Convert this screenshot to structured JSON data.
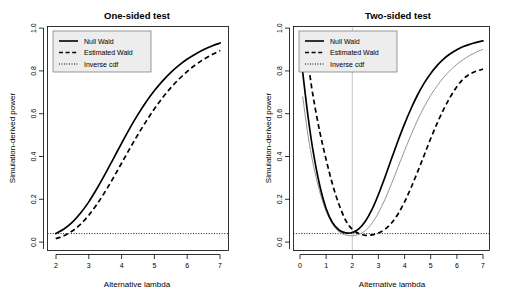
{
  "figure": {
    "background": "#ffffff",
    "panel_count": 2
  },
  "chart_data": [
    {
      "type": "line",
      "panel": "left",
      "title": "One-sided test",
      "xlabel": "Alternative lambda",
      "ylabel": "Simulation-derived power",
      "xlim": [
        1.75,
        7.25
      ],
      "ylim": [
        -0.03,
        1.03
      ],
      "xticks": [
        "2",
        "3",
        "4",
        "5",
        "6",
        "7"
      ],
      "xtick_values": [
        2,
        3,
        4,
        5,
        6,
        7
      ],
      "yticks": [
        "0.0",
        "0.2",
        "0.4",
        "0.6",
        "0.8",
        "1.0"
      ],
      "ytick_values": [
        0.0,
        0.2,
        0.4,
        0.6,
        0.8,
        1.0
      ],
      "grid": false,
      "legend_position": "top-left",
      "legend": [
        "Null Wald",
        "Estimated Wald",
        "Inverse cdf"
      ],
      "reference_lines": [
        {
          "orientation": "horizontal",
          "value": 0.05,
          "style": "dotted",
          "color": "#000000"
        }
      ],
      "x": [
        2.0,
        2.25,
        2.5,
        2.75,
        3.0,
        3.25,
        3.5,
        3.75,
        4.0,
        4.25,
        4.5,
        4.75,
        5.0,
        5.25,
        5.5,
        5.75,
        6.0,
        6.25,
        6.5,
        6.75,
        7.0
      ],
      "series": [
        {
          "name": "Null Wald",
          "style": "solid",
          "color": "#000000",
          "values": [
            0.05,
            0.072,
            0.103,
            0.146,
            0.199,
            0.262,
            0.331,
            0.404,
            0.477,
            0.548,
            0.614,
            0.674,
            0.727,
            0.773,
            0.813,
            0.847,
            0.876,
            0.9,
            0.921,
            0.938,
            0.952
          ]
        },
        {
          "name": "Estimated Wald",
          "style": "dashed",
          "color": "#000000",
          "values": [
            0.026,
            0.04,
            0.062,
            0.094,
            0.136,
            0.188,
            0.248,
            0.314,
            0.383,
            0.452,
            0.519,
            0.582,
            0.641,
            0.694,
            0.741,
            0.782,
            0.818,
            0.849,
            0.875,
            0.897,
            0.916
          ]
        }
      ]
    },
    {
      "type": "line",
      "panel": "right",
      "title": "Two-sided test",
      "xlabel": "Alternative lambda",
      "ylabel": "Simulation-derived power",
      "xlim": [
        -0.25,
        7.25
      ],
      "ylim": [
        -0.03,
        1.03
      ],
      "xticks": [
        "0",
        "1",
        "2",
        "3",
        "4",
        "5",
        "6",
        "7"
      ],
      "xtick_values": [
        0,
        1,
        2,
        3,
        4,
        5,
        6,
        7
      ],
      "yticks": [
        "0.0",
        "0.2",
        "0.4",
        "0.6",
        "0.8",
        "1.0"
      ],
      "ytick_values": [
        0.0,
        0.2,
        0.4,
        0.6,
        0.8,
        1.0
      ],
      "grid": false,
      "legend_position": "top-left",
      "legend": [
        "Null Wald",
        "Estimated Wald",
        "Inverse cdf"
      ],
      "reference_lines": [
        {
          "orientation": "horizontal",
          "value": 0.05,
          "style": "dotted",
          "color": "#000000"
        },
        {
          "orientation": "vertical",
          "value": 2.0,
          "style": "solid-thin",
          "color": "#aaaaaa"
        }
      ],
      "x": [
        0.1,
        0.3,
        0.5,
        0.75,
        1.0,
        1.25,
        1.5,
        1.75,
        2.0,
        2.25,
        2.5,
        2.75,
        3.0,
        3.25,
        3.5,
        3.75,
        4.0,
        4.25,
        4.5,
        4.75,
        5.0,
        5.25,
        5.5,
        5.75,
        6.0,
        6.25,
        6.5,
        6.75,
        7.0
      ],
      "series": [
        {
          "name": "Null Wald",
          "style": "solid",
          "color": "#000000",
          "values": [
            0.815,
            0.61,
            0.44,
            0.28,
            0.168,
            0.1,
            0.066,
            0.053,
            0.055,
            0.072,
            0.108,
            0.163,
            0.235,
            0.317,
            0.404,
            0.489,
            0.569,
            0.642,
            0.707,
            0.762,
            0.808,
            0.846,
            0.877,
            0.901,
            0.92,
            0.935,
            0.946,
            0.955,
            0.962
          ]
        },
        {
          "name": "Estimated Wald",
          "style": "dashed",
          "color": "#000000",
          "values": [
            0.99,
            0.86,
            0.7,
            0.535,
            0.4,
            0.28,
            0.185,
            0.112,
            0.07,
            0.05,
            0.042,
            0.044,
            0.053,
            0.07,
            0.1,
            0.143,
            0.2,
            0.268,
            0.343,
            0.421,
            0.5,
            0.573,
            0.639,
            0.697,
            0.745,
            0.782,
            0.805,
            0.819,
            0.828
          ]
        },
        {
          "name": "Inverse cdf",
          "style": "thin",
          "color": "#888888",
          "values": [
            0.7,
            0.52,
            0.38,
            0.25,
            0.155,
            0.094,
            0.058,
            0.043,
            0.04,
            0.046,
            0.064,
            0.098,
            0.148,
            0.212,
            0.286,
            0.364,
            0.443,
            0.518,
            0.588,
            0.65,
            0.704,
            0.75,
            0.79,
            0.823,
            0.851,
            0.874,
            0.893,
            0.909,
            0.922
          ]
        }
      ]
    }
  ]
}
